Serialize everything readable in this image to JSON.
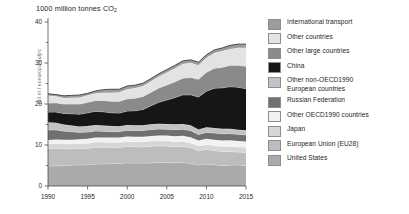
{
  "chart_data": {
    "type": "area",
    "stacked": true,
    "title": "1000 million tonnes CO2",
    "title_main": "1000 million tonnes CO",
    "title_sub": "2",
    "xlabel": "",
    "ylabel": "1000 million tonnes CO2",
    "xlim": [
      1990,
      2015
    ],
    "ylim": [
      0,
      40
    ],
    "grid": false,
    "legend_position": "right",
    "x": [
      1990,
      1991,
      1992,
      1993,
      1994,
      1995,
      1996,
      1997,
      1998,
      1999,
      2000,
      2001,
      2002,
      2003,
      2004,
      2005,
      2006,
      2007,
      2008,
      2009,
      2010,
      2011,
      2012,
      2013,
      2014,
      2015
    ],
    "xticks": [
      1990,
      1995,
      2000,
      2005,
      2010,
      2015
    ],
    "xticklabels": [
      "1990",
      "1995",
      "2000",
      "2005",
      "2010",
      "2015"
    ],
    "yticks": [
      0,
      10,
      20,
      30,
      40
    ],
    "yticklabels": [
      "0",
      "10",
      "20",
      "30",
      "40"
    ],
    "yminorticks": [
      5,
      15,
      25,
      35
    ],
    "totals": [
      22.5,
      22.3,
      22.0,
      22.1,
      22.2,
      22.6,
      23.2,
      23.5,
      23.5,
      23.6,
      24.2,
      24.5,
      25.0,
      26.2,
      27.4,
      28.4,
      29.4,
      30.4,
      30.8,
      30.2,
      32.0,
      33.2,
      33.7,
      34.3,
      34.6,
      34.6
    ],
    "series": [
      {
        "name": "United States",
        "color": "#aaaaaa",
        "values": [
          4.85,
          4.95,
          5.0,
          5.1,
          5.15,
          5.2,
          5.35,
          5.45,
          5.45,
          5.5,
          5.7,
          5.6,
          5.6,
          5.65,
          5.75,
          5.75,
          5.65,
          5.75,
          5.55,
          5.15,
          5.35,
          5.2,
          5.0,
          5.1,
          5.15,
          5.0
        ]
      },
      {
        "name": "European Union (EU28)",
        "color": "#bdbdbd",
        "values": [
          4.3,
          4.25,
          4.1,
          4.0,
          3.95,
          4.0,
          4.1,
          4.0,
          4.0,
          3.9,
          3.95,
          4.0,
          3.95,
          4.05,
          4.05,
          4.0,
          3.95,
          3.9,
          3.8,
          3.5,
          3.6,
          3.45,
          3.4,
          3.3,
          3.15,
          3.2
        ]
      },
      {
        "name": "Japan",
        "color": "#d6d6d6",
        "values": [
          1.15,
          1.18,
          1.2,
          1.2,
          1.25,
          1.25,
          1.28,
          1.27,
          1.22,
          1.25,
          1.25,
          1.22,
          1.26,
          1.28,
          1.27,
          1.26,
          1.25,
          1.28,
          1.2,
          1.11,
          1.17,
          1.24,
          1.28,
          1.3,
          1.26,
          1.23
        ]
      },
      {
        "name": "Other OECD1990 countries",
        "color": "#f2f2f2",
        "values": [
          0.95,
          0.97,
          0.99,
          1.0,
          1.03,
          1.06,
          1.09,
          1.11,
          1.13,
          1.15,
          1.18,
          1.19,
          1.21,
          1.24,
          1.27,
          1.29,
          1.31,
          1.34,
          1.35,
          1.33,
          1.38,
          1.4,
          1.41,
          1.43,
          1.44,
          1.45
        ]
      },
      {
        "name": "Russian Federation",
        "color": "#707070",
        "values": [
          2.45,
          2.35,
          2.1,
          1.95,
          1.7,
          1.65,
          1.6,
          1.5,
          1.45,
          1.48,
          1.5,
          1.52,
          1.52,
          1.55,
          1.56,
          1.56,
          1.6,
          1.58,
          1.62,
          1.5,
          1.6,
          1.65,
          1.68,
          1.65,
          1.62,
          1.6
        ]
      },
      {
        "name": "Other non-OECD1990 European countries",
        "color": "#c2c2c2",
        "values": [
          1.85,
          1.75,
          1.6,
          1.52,
          1.45,
          1.45,
          1.46,
          1.42,
          1.38,
          1.32,
          1.3,
          1.3,
          1.28,
          1.3,
          1.3,
          1.28,
          1.3,
          1.28,
          1.28,
          1.18,
          1.22,
          1.22,
          1.18,
          1.16,
          1.12,
          1.12
        ]
      },
      {
        "name": "China",
        "color": "#161616",
        "values": [
          2.48,
          2.6,
          2.7,
          2.85,
          3.0,
          3.25,
          3.35,
          3.35,
          3.25,
          3.2,
          3.4,
          3.55,
          3.85,
          4.5,
          5.25,
          5.85,
          6.5,
          7.1,
          7.45,
          7.95,
          8.8,
          9.7,
          10.0,
          10.3,
          10.35,
          10.15
        ]
      },
      {
        "name": "Other large countries",
        "color": "#8a8a8a",
        "values": [
          2.2,
          2.25,
          2.3,
          2.38,
          2.45,
          2.55,
          2.65,
          2.75,
          2.8,
          2.88,
          2.98,
          3.05,
          3.15,
          3.3,
          3.48,
          3.65,
          3.85,
          4.05,
          4.25,
          4.3,
          4.6,
          4.85,
          5.0,
          5.2,
          5.35,
          5.45
        ]
      },
      {
        "name": "Other countries",
        "color": "#e3e3e3",
        "values": [
          1.85,
          1.6,
          1.48,
          1.55,
          1.62,
          1.7,
          1.75,
          1.88,
          2.08,
          2.2,
          2.35,
          2.45,
          2.55,
          2.7,
          2.8,
          3.05,
          3.25,
          3.45,
          3.55,
          3.45,
          3.55,
          3.7,
          3.95,
          4.0,
          4.25,
          4.5
        ]
      },
      {
        "name": "International transport",
        "color": "#9c9c9c",
        "values": [
          0.42,
          0.4,
          0.53,
          0.55,
          0.6,
          0.49,
          0.57,
          0.77,
          0.84,
          0.72,
          0.79,
          0.72,
          0.72,
          0.63,
          0.67,
          0.7,
          0.74,
          0.77,
          0.73,
          0.73,
          0.73,
          0.79,
          0.77,
          0.86,
          0.91,
          0.9
        ]
      }
    ]
  },
  "legend": {
    "items": [
      {
        "label": "International transport",
        "label2": "",
        "color": "#9c9c9c"
      },
      {
        "label": "Other countries",
        "label2": "",
        "color": "#e3e3e3"
      },
      {
        "label": "Other large countries",
        "label2": "",
        "color": "#8a8a8a"
      },
      {
        "label": "China",
        "label2": "",
        "color": "#161616"
      },
      {
        "label": "Other non-OECD1990",
        "label2": "European countries",
        "color": "#c2c2c2"
      },
      {
        "label": "Russian Federation",
        "label2": "",
        "color": "#707070"
      },
      {
        "label": "Other OECD1990 countries",
        "label2": "",
        "color": "#f2f2f2"
      },
      {
        "label": "Japan",
        "label2": "",
        "color": "#d6d6d6"
      },
      {
        "label": "European Union (EU28)",
        "label2": "",
        "color": "#bdbdbd"
      },
      {
        "label": "United States",
        "label2": "",
        "color": "#aaaaaa"
      }
    ]
  },
  "watermark": {
    "text": "pbl.nl / eceuropa.eu/jrc"
  },
  "axis": {
    "y_ticks": [
      "0",
      "10",
      "20",
      "30",
      "40"
    ],
    "x_ticks": [
      "1990",
      "1995",
      "2000",
      "2005",
      "2010",
      "2015"
    ]
  }
}
